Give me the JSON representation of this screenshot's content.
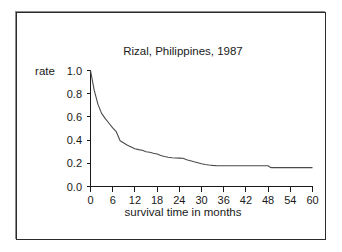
{
  "figure": {
    "frame_border_color": "#2b2b2b",
    "background_color": "#ffffff"
  },
  "chart_data": {
    "type": "line",
    "title": "Rizal, Philippines, 1987",
    "xlabel": "survival time in months",
    "ylabel": "rate",
    "xlim": [
      0,
      60
    ],
    "ylim": [
      0.0,
      1.0
    ],
    "grid": false,
    "legend": null,
    "line_color": "#4a4a4a",
    "xticks": [
      0,
      6,
      12,
      18,
      24,
      30,
      36,
      42,
      48,
      54,
      60
    ],
    "xticklabels": [
      "0",
      "6",
      "12",
      "18",
      "24",
      "30",
      "36",
      "42",
      "48",
      "54",
      "60"
    ],
    "yticks": [
      0.0,
      0.2,
      0.4,
      0.6,
      0.8,
      1.0
    ],
    "yticklabels": [
      "0.0",
      "0.2",
      "0.4",
      "0.6",
      "0.8",
      "1.0"
    ],
    "series": [
      {
        "name": "survival rate",
        "x": [
          0,
          1,
          2,
          3,
          4,
          5,
          6,
          7,
          8,
          9,
          10,
          11,
          12,
          13,
          14,
          15,
          16,
          17,
          18,
          19,
          20,
          21,
          22,
          23,
          24,
          25,
          26,
          27,
          28,
          29,
          30,
          31,
          32,
          33,
          34,
          36,
          40,
          44,
          48,
          48.6,
          49,
          54,
          60
        ],
        "y": [
          1.0,
          0.83,
          0.71,
          0.63,
          0.585,
          0.545,
          0.505,
          0.47,
          0.395,
          0.375,
          0.355,
          0.34,
          0.325,
          0.318,
          0.312,
          0.3,
          0.295,
          0.287,
          0.28,
          0.268,
          0.258,
          0.252,
          0.248,
          0.246,
          0.245,
          0.243,
          0.23,
          0.222,
          0.213,
          0.205,
          0.196,
          0.19,
          0.185,
          0.182,
          0.18,
          0.179,
          0.179,
          0.179,
          0.179,
          0.165,
          0.163,
          0.163,
          0.163
        ]
      }
    ]
  }
}
